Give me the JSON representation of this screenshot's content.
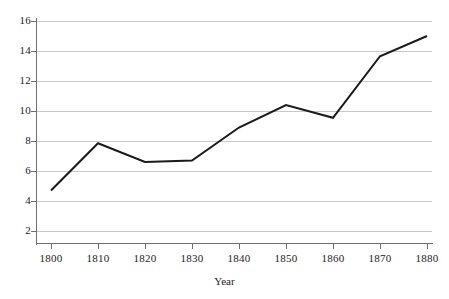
{
  "chart_data": {
    "type": "line",
    "title": "",
    "xlabel": "Year",
    "ylabel": "",
    "x": [
      1800,
      1810,
      1820,
      1830,
      1840,
      1850,
      1860,
      1870,
      1880
    ],
    "categories": [
      "1800",
      "1810",
      "1820",
      "1830",
      "1840",
      "1850",
      "1860",
      "1870",
      "1880"
    ],
    "values": [
      4.7,
      7.85,
      6.6,
      6.7,
      8.9,
      10.4,
      9.55,
      13.65,
      15.0
    ],
    "series": [
      {
        "name": "",
        "values": [
          4.7,
          7.85,
          6.6,
          6.7,
          8.9,
          10.4,
          9.55,
          13.65,
          15.0
        ]
      }
    ],
    "xlim": [
      1800,
      1880
    ],
    "ylim": [
      0,
      16
    ],
    "ytick_labels": [
      "2",
      "4",
      "6",
      "8",
      "10",
      "12",
      "14",
      "16"
    ],
    "ytick_values": [
      2,
      4,
      6,
      8,
      10,
      12,
      14,
      16
    ],
    "xtick_labels": [
      "1800",
      "1810",
      "1820",
      "1830",
      "1840",
      "1850",
      "1860",
      "1870",
      "1880"
    ],
    "grid": "horizontal",
    "legend": "none",
    "line_color": "#1a1a1a",
    "grid_color": "#c9c9c9",
    "axis_color": "#6e6e6e",
    "background_color": "#ffffff"
  },
  "axis": {
    "x_title": "Year"
  }
}
